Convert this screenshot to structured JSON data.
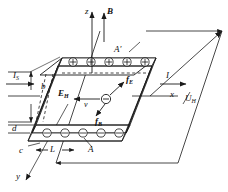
{
  "figure": {
    "type": "physics-diagram"
  },
  "axes": {
    "z": "z",
    "x": "x",
    "y": "y"
  },
  "vectors": {
    "magnetic_field": "B",
    "hall_field": "E",
    "hall_field_sub": "H",
    "electric_force": "f",
    "electric_force_sub": "E",
    "magnetic_force": "f",
    "magnetic_force_sub": "B",
    "drift_velocity": "v"
  },
  "currents": {
    "source_current": "I",
    "source_current_sub": "S",
    "slab_current": "I"
  },
  "voltage": {
    "hall_voltage": "U",
    "hall_voltage_sub": "H"
  },
  "dimensions": {
    "width_b": "b",
    "thickness_d": "d",
    "edge_c": "c",
    "length_L": "L",
    "face_A": "A",
    "face_A_prime": "A′"
  },
  "charges": {
    "positive_symbol": "+",
    "positive_count": 5,
    "negative_symbol": "−",
    "negative_count": 5,
    "carrier_symbol": "−"
  },
  "colors": {
    "line": "#1a1a1a",
    "background": "#ffffff",
    "dashed": "#1a1a1a"
  }
}
